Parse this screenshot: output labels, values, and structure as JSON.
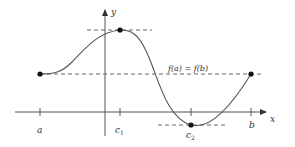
{
  "diagram": {
    "axes": {
      "x_label": "x",
      "y_label": "y"
    },
    "tick_labels": {
      "a": "a",
      "c1": "c",
      "c1_sub": "1",
      "c2": "c",
      "c2_sub": "2",
      "b": "b"
    },
    "annotation": "f(a) = f(b)",
    "points": [
      {
        "name": "a",
        "px": [
          40,
          74
        ]
      },
      {
        "name": "c1-max",
        "px": [
          120,
          30
        ]
      },
      {
        "name": "c2-min",
        "px": [
          191,
          125
        ]
      },
      {
        "name": "b",
        "px": [
          251,
          74
        ]
      }
    ],
    "colors": {
      "curve": "#555555",
      "axis": "#444444",
      "dashed": "#666666",
      "point": "#111111"
    }
  }
}
